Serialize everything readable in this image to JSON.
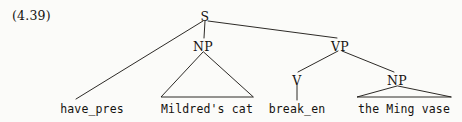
{
  "figure": {
    "example_number": "(4.39)",
    "type": "syntax-tree",
    "sentence": "have_pres Mildred's cat break_en the Ming vase",
    "ink_color": "#15120f",
    "paper_color": "#fbfbf9"
  },
  "nodes": [
    {
      "id": "S",
      "label": "S",
      "x": 205,
      "y": 17,
      "kind": "nonterminal"
    },
    {
      "id": "NP1",
      "label": "NP",
      "x": 203,
      "y": 47,
      "kind": "nonterminal"
    },
    {
      "id": "VP",
      "label": "VP",
      "x": 340,
      "y": 47,
      "kind": "nonterminal"
    },
    {
      "id": "V",
      "label": "V",
      "x": 297,
      "y": 81,
      "kind": "nonterminal"
    },
    {
      "id": "NP2",
      "label": "NP",
      "x": 397,
      "y": 81,
      "kind": "nonterminal"
    }
  ],
  "terminals": [
    {
      "id": "t1",
      "label": "have_pres",
      "x": 92,
      "y": 113
    },
    {
      "id": "t2",
      "label": "Mildred's cat",
      "x": 207,
      "y": 113
    },
    {
      "id": "t3",
      "label": "break_en",
      "x": 297,
      "y": 113
    },
    {
      "id": "t4",
      "label": "the Ming vase",
      "x": 404,
      "y": 113
    }
  ],
  "edges": [
    {
      "from": "S",
      "to": "have_pres-terminal",
      "x1": 203,
      "y1": 21,
      "x2": 76,
      "y2": 99
    },
    {
      "from": "S",
      "to": "NP1",
      "x1": 205,
      "y1": 21,
      "x2": 204,
      "y2": 38
    },
    {
      "from": "S",
      "to": "VP",
      "x1": 208,
      "y1": 21,
      "x2": 337,
      "y2": 38
    },
    {
      "from": "VP",
      "to": "V",
      "x1": 338,
      "y1": 51,
      "x2": 298,
      "y2": 72
    },
    {
      "from": "VP",
      "to": "NP2",
      "x1": 342,
      "y1": 51,
      "x2": 394,
      "y2": 72
    },
    {
      "from": "V",
      "to": "break_en-terminal",
      "x1": 297,
      "y1": 85,
      "x2": 297,
      "y2": 100
    }
  ],
  "triangles": [
    {
      "id": "tri-np1",
      "under": "NP1",
      "apex_x": 203,
      "apex_y": 52,
      "left_x": 161,
      "right_x": 253,
      "base_y": 97
    },
    {
      "id": "tri-np2",
      "under": "NP2",
      "apex_x": 397,
      "apex_y": 86,
      "left_x": 357,
      "right_x": 451,
      "base_y": 97
    }
  ]
}
